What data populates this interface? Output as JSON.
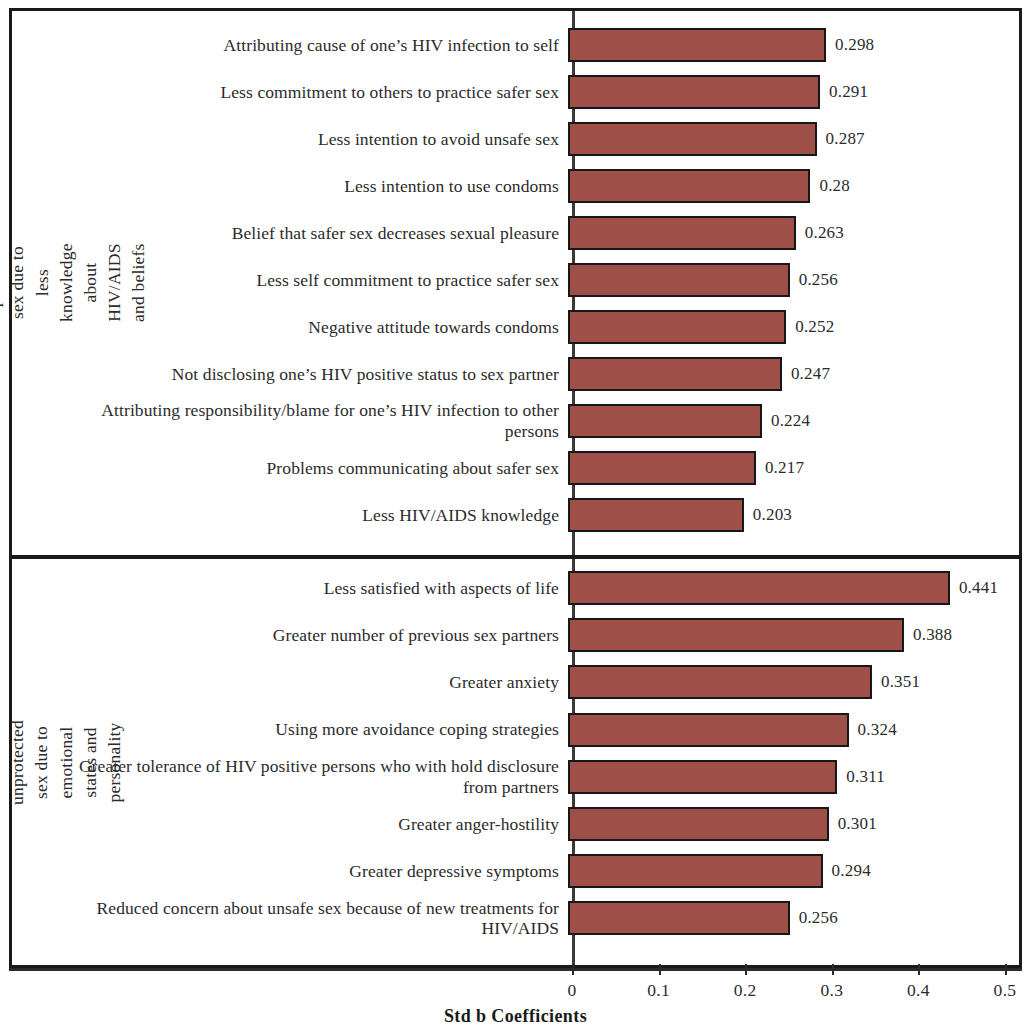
{
  "chart_data": {
    "type": "bar",
    "orientation": "horizontal",
    "title": "",
    "xlabel": "Std b Coefficients",
    "ylabel": "",
    "xlim": [
      0,
      0.5
    ],
    "xticks": [
      "0",
      "0.1",
      "0.2",
      "0.3",
      "0.4",
      "0.5"
    ],
    "xtick_values": [
      0,
      0.1,
      0.2,
      0.3,
      0.4,
      0.5
    ],
    "grid": false,
    "legend": false,
    "bar_color": "#9e4f48",
    "bar_edge_color": "#171717",
    "panels": [
      {
        "panel_id": "knowledge",
        "ylabel": "Likelihood  of unprotected sex due to less knowledge about HIV/AIDS and beliefs",
        "categories": [
          "Attributing  cause of one’s HIV infection  to self",
          "Less commitment to others to practice safer sex",
          "Less intention to avoid unsafe  sex",
          "Less intention to use condoms",
          "Belief that safer sex decreases sexual pleasure",
          "Less self commitment to practice safer sex",
          "Negative  attitude  towards condoms",
          "Not disclosing  one’s HIV positive  status to sex partner",
          "Attributing  responsibility/blame  for one’s HIV infection  to other persons",
          "Problems communicating about safer sex",
          "Less HIV/AIDS knowledge"
        ],
        "values": [
          0.298,
          0.291,
          0.287,
          0.28,
          0.263,
          0.256,
          0.252,
          0.247,
          0.224,
          0.217,
          0.203
        ],
        "value_labels": [
          "0.298",
          "0.291",
          "0.287",
          "0.28",
          "0.263",
          "0.256",
          "0.252",
          "0.247",
          "0.224",
          "0.217",
          "0.203"
        ]
      },
      {
        "panel_id": "emotional",
        "ylabel": "Likelihood  of unprotected sex due to emotional states and personality",
        "categories": [
          "Less satisfied with aspects of life",
          "Greater number of previous sex partners",
          "Greater anxiety",
          "Using more avoidance coping strategies",
          "Greater tolerance of HIV positive persons who with hold disclosure from partners",
          "Greater anger-hostility",
          "Greater depressive symptoms",
          "Reduced concern about unsafe sex because of new treatments for HIV/AIDS"
        ],
        "values": [
          0.441,
          0.388,
          0.351,
          0.324,
          0.311,
          0.301,
          0.294,
          0.256
        ],
        "value_labels": [
          "0.441",
          "0.388",
          "0.351",
          "0.324",
          "0.311",
          "0.301",
          "0.294",
          "0.256"
        ]
      }
    ]
  }
}
